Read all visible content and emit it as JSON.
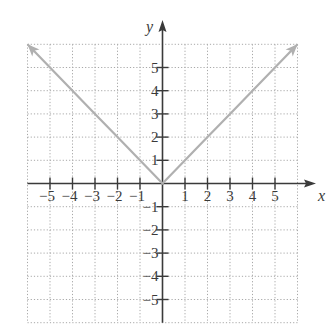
{
  "chart_data": {
    "type": "line",
    "title": "",
    "function": "y = |x|",
    "xlabel": "x",
    "ylabel": "y",
    "xlim": [
      -6,
      6
    ],
    "ylim": [
      -6,
      6
    ],
    "grid": true,
    "grid_style": "dotted",
    "x_ticks": [
      -5,
      -4,
      -3,
      -2,
      -1,
      1,
      2,
      3,
      4,
      5
    ],
    "y_ticks": [
      -5,
      -4,
      -3,
      -2,
      -1,
      1,
      2,
      3,
      4,
      5
    ],
    "x_tick_labels": [
      "−5",
      "−4",
      "−3",
      "−2",
      "−1",
      "1",
      "2",
      "3",
      "4",
      "5"
    ],
    "y_tick_labels": [
      "−5",
      "−4",
      "−3",
      "−2",
      "−1",
      "1",
      "2",
      "3",
      "4",
      "5"
    ],
    "series": [
      {
        "name": "y = |x|",
        "x": [
          -6,
          -5,
          -4,
          -3,
          -2,
          -1,
          0,
          1,
          2,
          3,
          4,
          5,
          6
        ],
        "y": [
          6,
          5,
          4,
          3,
          2,
          1,
          0,
          1,
          2,
          3,
          4,
          5,
          6
        ],
        "color": "#b0b0b0",
        "arrows_at_ends": true
      }
    ],
    "legend": null
  },
  "colors": {
    "axis": "#3a3a3a",
    "grid": "#a8a8a8",
    "curve": "#b0b0b0"
  }
}
